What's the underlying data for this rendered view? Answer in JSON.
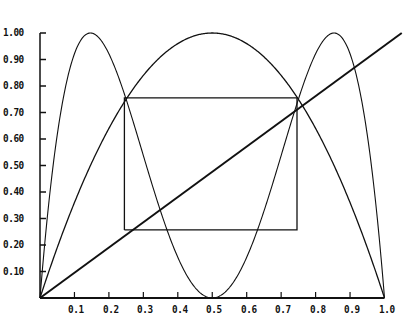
{
  "chart_data": {
    "type": "line",
    "title": "",
    "xlabel": "",
    "ylabel": "",
    "xlim": [
      0,
      1.0
    ],
    "ylim": [
      0,
      1.0
    ],
    "grid": false,
    "legend": null,
    "x_ticks": [
      "0.1",
      "0.2",
      "0.3",
      "0.4",
      "0.5",
      "0.6",
      "0.7",
      "0.8",
      "0.9",
      "1.0"
    ],
    "y_ticks": [
      "1.00",
      "0.90",
      "0.80",
      "0.70",
      "0.60",
      "0.50",
      "0.40",
      "0.30",
      "0.20",
      "0.10"
    ],
    "series": [
      {
        "name": "f(x) = 4x(1-x)",
        "type": "curve",
        "description": "single-humped parabola peaking at (0.5, 1.0)"
      },
      {
        "name": "f(f(x))",
        "type": "curve",
        "description": "double-humped curve with peaks at x≈0.146 and x≈0.854 (y=1.0), minimum at (0.5, 0)"
      },
      {
        "name": "y = x",
        "type": "line",
        "points": [
          [
            0,
            0
          ],
          [
            1.05,
            1.0
          ]
        ]
      },
      {
        "name": "period-2 cycle box",
        "type": "polygon",
        "points": [
          [
            0.245,
            0.257
          ],
          [
            0.245,
            0.755
          ],
          [
            0.746,
            0.755
          ],
          [
            0.746,
            0.257
          ],
          [
            0.245,
            0.257
          ]
        ]
      }
    ],
    "annotations": [
      {
        "label": "fixed point",
        "x": 0.75,
        "y": 0.75
      },
      {
        "label": "intersection",
        "x": 0.245,
        "y": 0.755
      }
    ]
  },
  "plot": {
    "origin_px": [
      40,
      298
    ],
    "x_scale_px": 344.5,
    "y_scale_px": 265,
    "line_color": "#111111",
    "background": "#ffffff"
  }
}
